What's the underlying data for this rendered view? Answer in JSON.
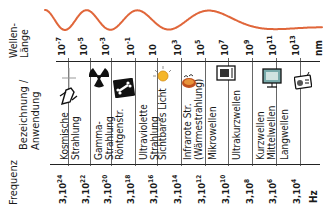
{
  "wave": {
    "label_line1": "Wellen-",
    "label_line2": "Länge",
    "color": "#e0663a",
    "unit": "nm",
    "ticks": [
      {
        "base": "10",
        "exp": "-7"
      },
      {
        "base": "10",
        "exp": "-5"
      },
      {
        "base": "10",
        "exp": "-3"
      },
      {
        "base": "10",
        "exp": "-1"
      },
      {
        "base": "10",
        "exp": ""
      },
      {
        "base": "10",
        "exp": "3"
      },
      {
        "base": "10",
        "exp": "5"
      },
      {
        "base": "10",
        "exp": "7"
      },
      {
        "base": "10",
        "exp": "9"
      },
      {
        "base": "10",
        "exp": "11"
      },
      {
        "base": "10",
        "exp": "13"
      }
    ]
  },
  "rows": {
    "category_label_line1": "Bezeichnung /",
    "category_label_line2": "Anwendung",
    "frequency_label": "Frequenz"
  },
  "categories": [
    {
      "line1": "Kosmische",
      "line2": "Strahlung",
      "icon": "space-shuttle-icon"
    },
    {
      "line1": "Gamma-",
      "line2": "Strahlung",
      "icon": "radiation-icon"
    },
    {
      "line1": "Röntgenstr.",
      "line2": "",
      "icon": "xray-bone-icon"
    },
    {
      "line1": "Ultraviolette",
      "line2": "Strahlung",
      "icon": ""
    },
    {
      "line1": "Sichtbares Licht",
      "line2": "",
      "icon": "sun-icon"
    },
    {
      "line1": "Infrarote Str.",
      "line2": "(Wärmestrahlung)",
      "icon": "heat-lamp-icon"
    },
    {
      "line1": "Mikrowellen",
      "line2": "",
      "icon": "microwave-icon"
    },
    {
      "line1": "Ultrakurzwellen",
      "line2": "",
      "icon": ""
    },
    {
      "line1": "Kurzwellen",
      "line2": "Mittelwellen",
      "icon": "television-icon"
    },
    {
      "line1": "Langwellen",
      "line2": "",
      "icon": "radio-icon"
    }
  ],
  "frequency": {
    "unit": "Hz",
    "ticks": [
      {
        "base": "3,10",
        "exp": "24"
      },
      {
        "base": "3,10",
        "exp": "22"
      },
      {
        "base": "3,10",
        "exp": "20"
      },
      {
        "base": "3,10",
        "exp": "18"
      },
      {
        "base": "3,10",
        "exp": "16"
      },
      {
        "base": "3,10",
        "exp": "14"
      },
      {
        "base": "3,10",
        "exp": "12"
      },
      {
        "base": "3,10",
        "exp": "10"
      },
      {
        "base": "3,10",
        "exp": "8"
      },
      {
        "base": "3,10",
        "exp": "6"
      },
      {
        "base": "3,10",
        "exp": "4"
      }
    ]
  }
}
